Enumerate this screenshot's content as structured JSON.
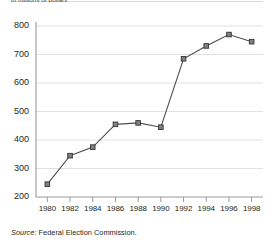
{
  "figure": {
    "subtitle": "In millions of dollars",
    "source_prefix": "Source:",
    "source_text": "Federal Election Commission."
  },
  "chart_data": {
    "type": "line",
    "title": "",
    "subtitle": "In millions of dollars",
    "xlabel": "",
    "ylabel": "",
    "categories": [
      "1980",
      "1982",
      "1984",
      "1986",
      "1988",
      "1990",
      "1992",
      "1994",
      "1996",
      "1998"
    ],
    "x": [
      1980,
      1982,
      1984,
      1986,
      1988,
      1990,
      1992,
      1994,
      1996,
      1998
    ],
    "values": [
      245,
      345,
      375,
      455,
      460,
      445,
      685,
      730,
      770,
      745
    ],
    "series": [
      {
        "name": "Campaign spending",
        "values": [
          245,
          345,
          375,
          455,
          460,
          445,
          685,
          730,
          770,
          745
        ]
      }
    ],
    "ylim": [
      200,
      800
    ],
    "yticks": [
      200,
      300,
      400,
      500,
      600,
      700,
      800
    ],
    "ytick_labels": [
      "200",
      "300",
      "400",
      "500",
      "600",
      "700",
      "800"
    ],
    "xlim": [
      1979,
      1999
    ],
    "xticks": [
      1980,
      1982,
      1984,
      1986,
      1988,
      1990,
      1992,
      1994,
      1996,
      1998
    ],
    "xtick_labels": [
      "1980",
      "1982",
      "1984",
      "1986",
      "1988",
      "1990",
      "1992",
      "1994",
      "1996",
      "1998"
    ],
    "grid": "horizontal",
    "legend": "none",
    "marker": "square",
    "colors": {
      "line": "#4d4d4d",
      "marker_fill": "#808080",
      "marker_edge": "#333333",
      "grid": "#d9d9d9",
      "axis": "#9a9a9a",
      "text": "#231f20"
    },
    "annotations": []
  }
}
